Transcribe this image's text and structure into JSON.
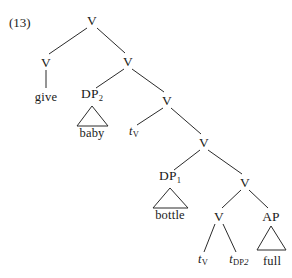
{
  "figure": {
    "example_number": "(13)",
    "width": 292,
    "height": 278,
    "line_color": "#2b2b2b",
    "text_color": "#1a1a1a",
    "background": "#ffffff"
  },
  "nodes": [
    {
      "id": "v-root",
      "label": "V",
      "sub": "",
      "kind": "cat",
      "x": 92,
      "y": 20
    },
    {
      "id": "v-left",
      "label": "V",
      "sub": "",
      "kind": "cat",
      "x": 46,
      "y": 62
    },
    {
      "id": "give",
      "label": "give",
      "sub": "",
      "kind": "word",
      "x": 46,
      "y": 97
    },
    {
      "id": "v-2",
      "label": "V",
      "sub": "",
      "kind": "cat",
      "x": 128,
      "y": 61
    },
    {
      "id": "dp2",
      "label": "DP",
      "sub": "2",
      "kind": "cat",
      "x": 92,
      "y": 96
    },
    {
      "id": "baby",
      "label": "baby",
      "sub": "",
      "kind": "word",
      "x": 92,
      "y": 133
    },
    {
      "id": "v-3",
      "label": "V",
      "sub": "",
      "kind": "cat",
      "x": 167,
      "y": 100
    },
    {
      "id": "tv-1",
      "label": "t",
      "sub": "V",
      "kind": "trace",
      "x": 134,
      "y": 133
    },
    {
      "id": "v-4",
      "label": "V",
      "sub": "",
      "kind": "cat",
      "x": 204,
      "y": 142
    },
    {
      "id": "dp1",
      "label": "DP",
      "sub": "1",
      "kind": "cat",
      "x": 170,
      "y": 178
    },
    {
      "id": "bottle",
      "label": "bottle",
      "sub": "",
      "kind": "word",
      "x": 170,
      "y": 215
    },
    {
      "id": "v-5",
      "label": "V",
      "sub": "",
      "kind": "cat",
      "x": 245,
      "y": 182
    },
    {
      "id": "v-6",
      "label": "V",
      "sub": "",
      "kind": "cat",
      "x": 219,
      "y": 216
    },
    {
      "id": "tv-2",
      "label": "t",
      "sub": "V",
      "kind": "trace",
      "x": 203,
      "y": 261
    },
    {
      "id": "tdp2",
      "label": "t",
      "sub": "DP2",
      "kind": "trace",
      "x": 239,
      "y": 261
    },
    {
      "id": "ap",
      "label": "AP",
      "sub": "",
      "kind": "cat",
      "x": 271,
      "y": 216
    },
    {
      "id": "full",
      "label": "full",
      "sub": "",
      "kind": "word",
      "x": 272,
      "y": 261
    }
  ],
  "edges": [
    {
      "from": "v-root",
      "to": "v-left",
      "x1": 87,
      "y1": 28,
      "x2": 49,
      "y2": 54
    },
    {
      "from": "v-root",
      "to": "v-2",
      "x1": 97,
      "y1": 28,
      "x2": 125,
      "y2": 53
    },
    {
      "from": "v-left",
      "to": "give",
      "x1": 46,
      "y1": 70,
      "x2": 46,
      "y2": 88
    },
    {
      "from": "v-2",
      "to": "dp2",
      "x1": 124,
      "y1": 69,
      "x2": 96,
      "y2": 88
    },
    {
      "from": "v-2",
      "to": "v-3",
      "x1": 132,
      "y1": 69,
      "x2": 164,
      "y2": 92
    },
    {
      "from": "v-3",
      "to": "tv-1",
      "x1": 163,
      "y1": 108,
      "x2": 137,
      "y2": 125
    },
    {
      "from": "v-3",
      "to": "v-4",
      "x1": 171,
      "y1": 108,
      "x2": 201,
      "y2": 134
    },
    {
      "from": "v-4",
      "to": "dp1",
      "x1": 200,
      "y1": 150,
      "x2": 174,
      "y2": 170
    },
    {
      "from": "v-4",
      "to": "v-5",
      "x1": 208,
      "y1": 150,
      "x2": 242,
      "y2": 174
    },
    {
      "from": "v-5",
      "to": "v-6",
      "x1": 241,
      "y1": 190,
      "x2": 222,
      "y2": 208
    },
    {
      "from": "v-5",
      "to": "ap",
      "x1": 249,
      "y1": 190,
      "x2": 268,
      "y2": 208
    },
    {
      "from": "v-6",
      "to": "tv-2",
      "x1": 215,
      "y1": 224,
      "x2": 204,
      "y2": 252
    },
    {
      "from": "v-6",
      "to": "tdp2",
      "x1": 223,
      "y1": 224,
      "x2": 236,
      "y2": 252
    }
  ],
  "triangles": [
    {
      "for": "dp2",
      "apex_x": 92,
      "apex_y": 106,
      "left_x": 77,
      "right_x": 108,
      "base_y": 126
    },
    {
      "for": "dp1",
      "apex_x": 170,
      "apex_y": 188,
      "left_x": 153,
      "right_x": 188,
      "base_y": 208
    },
    {
      "for": "ap",
      "apex_x": 271,
      "apex_y": 226,
      "left_x": 257,
      "right_x": 286,
      "base_y": 250
    }
  ]
}
